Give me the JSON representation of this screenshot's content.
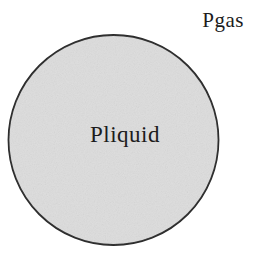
{
  "diagram": {
    "gas_label": "Pgas",
    "liquid_label": "Pliquid",
    "colors": {
      "background": "#ffffff",
      "droplet_fill": "#dddddd",
      "droplet_stroke": "#2a2a2a",
      "label_text": "#1c1c1c"
    }
  }
}
